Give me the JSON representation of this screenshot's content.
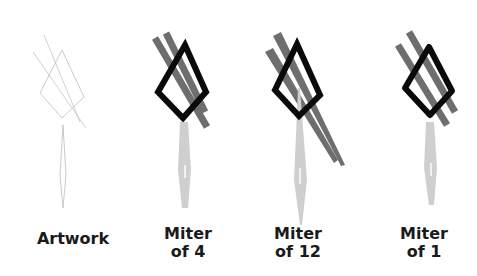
{
  "figure": {
    "panels": [
      {
        "id": "artwork",
        "label": "Artwork",
        "label_pos": {
          "x": 73,
          "y": 228
        },
        "style": "outline",
        "diamond": "62,50 84,97 62,118 40,93",
        "bars": [
          [
            "33,52",
            "86,128"
          ],
          [
            "44,35",
            "80,122"
          ]
        ],
        "spindle": "63,125 66,175 63,208 60,175"
      },
      {
        "id": "miter-4",
        "label": "Miter\nof 4",
        "label_pos": {
          "x": 188,
          "y": 226
        },
        "style": "stroked",
        "miter_limit": 4,
        "diamond": "185,45 206,92 183,118 158,92",
        "bars": [
          [
            "155,38",
            "207,127"
          ],
          [
            "166,33",
            "205,112"
          ]
        ],
        "spindle": "183,122 191,170 186,208 178,170"
      },
      {
        "id": "miter-12",
        "label": "Miter\nof 12",
        "label_pos": {
          "x": 298,
          "y": 226
        },
        "style": "stroked",
        "miter_limit": 12,
        "diamond": "297,44 320,95 299,116 275,90",
        "bars": [
          [
            "269,50",
            "330,152"
          ],
          [
            "277,34",
            "341,165"
          ]
        ],
        "spindle": "299,90 307,180 302,225 294,180"
      },
      {
        "id": "miter-1",
        "label": "Miter\nof 1",
        "label_pos": {
          "x": 424,
          "y": 226
        },
        "style": "stroked",
        "miter_limit": 1,
        "diamond": "429,47 452,91 430,115 405,88",
        "bars": [
          [
            "398,45",
            "447,125"
          ],
          [
            "409,32",
            "455,112"
          ]
        ],
        "spindle": "429,122 437,168 432,205 424,168"
      }
    ],
    "colors": {
      "background": "#ffffff",
      "outline_thin": "#b8b8b8",
      "diamond_stroke": "#0a0a0a",
      "bar_fill": "#6e6e6e",
      "spindle_fill": "#cfcfcf",
      "label": "#1a1a1a"
    }
  }
}
